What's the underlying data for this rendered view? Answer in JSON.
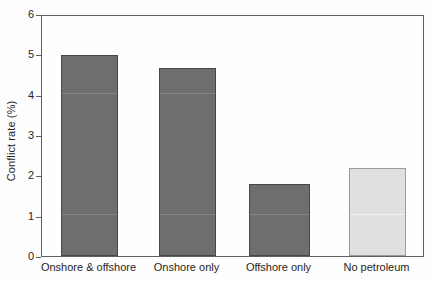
{
  "chart_data": {
    "type": "bar",
    "title": "",
    "xlabel": "",
    "ylabel": "Conflict rate (%)",
    "categories": [
      "Onshore & offshore",
      "Onshore only",
      "Offshore only",
      "No petroleum"
    ],
    "values": [
      4.98,
      4.65,
      1.78,
      2.18
    ],
    "ylim": [
      0,
      6
    ],
    "yticks": [
      "0",
      "1",
      "2",
      "3",
      "4",
      "5",
      "6"
    ],
    "ytick_values": [
      0,
      1,
      2,
      3,
      4,
      5,
      6
    ],
    "grid": false,
    "legend": "none",
    "bar_colors": [
      "#6e6e6e",
      "#6e6e6e",
      "#6e6e6e",
      "#e0e0e0"
    ],
    "bar_edge_colors": [
      "#474747",
      "#474747",
      "#474747",
      "#9a9a9a"
    ],
    "series": [
      {
        "name": "Conflict rate",
        "values": [
          4.98,
          4.65,
          1.78,
          2.18
        ]
      }
    ]
  },
  "axis": {
    "y_title": "Conflict rate (%)",
    "frame_color": "#5f5f5f"
  }
}
